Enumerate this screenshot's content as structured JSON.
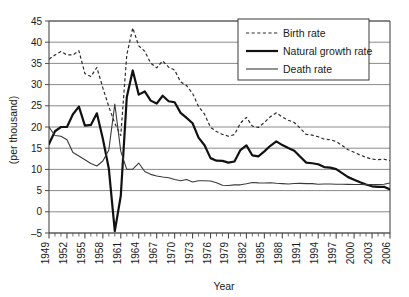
{
  "chart_data": {
    "type": "line",
    "title": "",
    "xlabel": "Year",
    "ylabel": "(per thousand)",
    "xlim": [
      1949,
      2006
    ],
    "ylim": [
      -5,
      45
    ],
    "ytick_step": 5,
    "xtick_step": 3,
    "grid": true,
    "legend_position": "top-right",
    "yticks": [
      -5,
      0,
      5,
      10,
      15,
      20,
      25,
      30,
      35,
      40,
      45
    ],
    "xticks": [
      1949,
      1952,
      1955,
      1958,
      1961,
      1964,
      1967,
      1970,
      1973,
      1976,
      1979,
      1982,
      1985,
      1988,
      1991,
      1994,
      1997,
      2000,
      2003,
      2006
    ],
    "x": [
      1949,
      1950,
      1951,
      1952,
      1953,
      1954,
      1955,
      1956,
      1957,
      1958,
      1959,
      1960,
      1961,
      1962,
      1963,
      1964,
      1965,
      1966,
      1967,
      1968,
      1969,
      1970,
      1971,
      1972,
      1973,
      1974,
      1975,
      1976,
      1977,
      1978,
      1979,
      1980,
      1981,
      1982,
      1983,
      1984,
      1985,
      1986,
      1987,
      1988,
      1989,
      1990,
      1991,
      1992,
      1993,
      1994,
      1995,
      1996,
      1997,
      1998,
      1999,
      2000,
      2001,
      2002,
      2003,
      2004,
      2005,
      2006
    ],
    "series": [
      {
        "name": "Birth rate",
        "style": "dashed",
        "color": "#2b2b2b",
        "width": 1.2,
        "values": [
          36.0,
          37.0,
          37.8,
          37.0,
          37.0,
          37.97,
          32.6,
          31.9,
          34.03,
          29.22,
          24.78,
          20.86,
          18.02,
          37.01,
          43.37,
          39.14,
          37.88,
          35.05,
          33.96,
          35.59,
          34.11,
          33.43,
          30.65,
          29.77,
          27.93,
          24.82,
          23.01,
          19.91,
          18.93,
          18.25,
          17.82,
          18.21,
          20.91,
          22.28,
          20.19,
          19.9,
          21.04,
          22.43,
          23.33,
          22.37,
          21.58,
          21.06,
          19.68,
          18.24,
          18.09,
          17.7,
          17.12,
          16.98,
          16.57,
          15.64,
          14.64,
          14.03,
          13.38,
          12.86,
          12.41,
          12.29,
          12.4,
          12.09
        ]
      },
      {
        "name": "Natural growth rate",
        "style": "solid-thick",
        "color": "#111111",
        "width": 2.2,
        "values": [
          16.0,
          19.0,
          20.0,
          20.0,
          23.0,
          24.79,
          20.32,
          20.5,
          23.23,
          17.24,
          10.19,
          -4.57,
          3.78,
          26.99,
          33.33,
          27.64,
          28.38,
          26.22,
          25.53,
          27.38,
          26.08,
          25.83,
          23.33,
          22.16,
          20.89,
          17.48,
          15.69,
          12.66,
          12.06,
          12.0,
          11.61,
          11.87,
          14.55,
          15.68,
          13.29,
          13.08,
          14.26,
          15.57,
          16.61,
          15.73,
          15.04,
          14.39,
          12.98,
          11.6,
          11.45,
          11.21,
          10.55,
          10.42,
          10.06,
          9.14,
          8.18,
          7.58,
          6.95,
          6.45,
          6.01,
          5.87,
          5.89,
          5.28
        ]
      },
      {
        "name": "Death rate",
        "style": "solid-thin",
        "color": "#3a3a3a",
        "width": 1.1,
        "values": [
          20.0,
          18.0,
          17.8,
          17.0,
          14.0,
          13.18,
          12.28,
          11.4,
          10.8,
          11.98,
          14.59,
          25.43,
          14.24,
          10.02,
          10.04,
          11.5,
          9.5,
          8.83,
          8.43,
          8.21,
          8.03,
          7.6,
          7.32,
          7.61,
          7.04,
          7.34,
          7.32,
          7.25,
          6.87,
          6.25,
          6.21,
          6.34,
          6.36,
          6.6,
          6.9,
          6.82,
          6.78,
          6.86,
          6.72,
          6.64,
          6.54,
          6.67,
          6.7,
          6.64,
          6.64,
          6.49,
          6.57,
          6.56,
          6.51,
          6.5,
          6.46,
          6.45,
          6.43,
          6.41,
          6.4,
          6.42,
          6.51,
          6.81
        ]
      }
    ]
  },
  "legend": {
    "items": [
      {
        "label": "Birth rate",
        "style": "dashed"
      },
      {
        "label": "Natural growth rate",
        "style": "solid-thick"
      },
      {
        "label": "Death rate",
        "style": "solid-thin"
      }
    ]
  },
  "axes": {
    "x_title": "Year",
    "y_title": "(per thousand)"
  },
  "colors": {
    "grid": "#7d7d7d",
    "frame": "#4a4a4a",
    "text": "#1a1a1a",
    "background": "#ffffff"
  }
}
